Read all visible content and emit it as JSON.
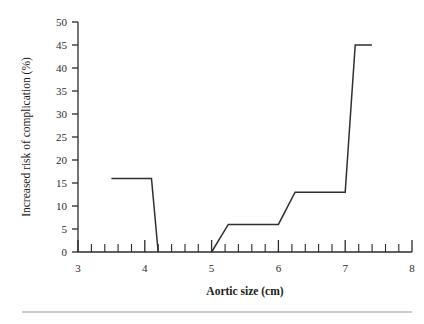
{
  "figure": {
    "background_color": "#ffffff",
    "line_color": "#2f2f2f",
    "axis_color": "#2b2b2b",
    "rule_color": "#9a9a9a"
  },
  "chart_data": {
    "type": "line",
    "title": "",
    "subtitle": "",
    "xlabel": "Aortic size (cm)",
    "ylabel": "Increased risk of complication (%)",
    "xlim": [
      3,
      8
    ],
    "ylim": [
      0,
      50
    ],
    "grid": false,
    "legend": false,
    "legend_position": "none",
    "x_ticks": [
      3,
      4,
      5,
      6,
      7,
      8
    ],
    "x_tick_labels": [
      "3",
      "4",
      "5",
      "6",
      "7",
      "8"
    ],
    "x_minor_tick_step": 0.2,
    "y_ticks": [
      0,
      5,
      10,
      15,
      20,
      25,
      30,
      35,
      40,
      45,
      50
    ],
    "y_tick_labels": [
      "0",
      "5",
      "10",
      "15",
      "20",
      "25",
      "30",
      "35",
      "40",
      "45",
      "50"
    ],
    "series": [
      {
        "name": "Increased risk of complication",
        "segments": [
          {
            "name": "segment-low-aortic-size",
            "points": [
              {
                "x": 3.5,
                "y": 16
              },
              {
                "x": 4.1,
                "y": 16
              },
              {
                "x": 4.2,
                "y": 0
              }
            ]
          },
          {
            "name": "segment-high-aortic-size",
            "points": [
              {
                "x": 5.0,
                "y": 0
              },
              {
                "x": 5.25,
                "y": 6
              },
              {
                "x": 6.0,
                "y": 6
              },
              {
                "x": 6.25,
                "y": 13
              },
              {
                "x": 7.0,
                "y": 13
              },
              {
                "x": 7.15,
                "y": 45
              },
              {
                "x": 7.4,
                "y": 45
              }
            ]
          }
        ]
      }
    ]
  }
}
